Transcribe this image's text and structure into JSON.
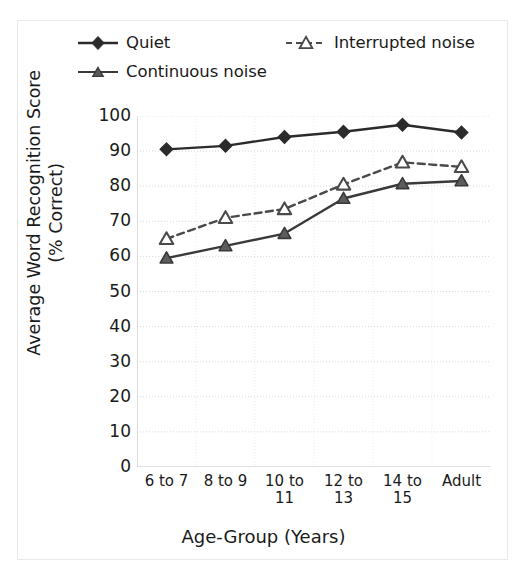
{
  "chart_data": {
    "type": "line",
    "title": "",
    "xlabel": "Age-Group (Years)",
    "ylabel": "Average Word Recognition Score (% Correct)",
    "ylabel_line1": "Average Word Recognition Score",
    "ylabel_line2": "(% Correct)",
    "categories": [
      "6 to 7",
      "8 to 9",
      "10 to\n11",
      "12 to\n13",
      "14 to\n15",
      "Adult"
    ],
    "category_labels": [
      {
        "line1": "6 to 7",
        "line2": ""
      },
      {
        "line1": "8 to 9",
        "line2": ""
      },
      {
        "line1": "10 to",
        "line2": "11"
      },
      {
        "line1": "12 to",
        "line2": "13"
      },
      {
        "line1": "14 to",
        "line2": "15"
      },
      {
        "line1": "Adult",
        "line2": ""
      }
    ],
    "ylim": [
      0,
      100
    ],
    "yticks": [
      100,
      90,
      80,
      70,
      60,
      50,
      40,
      30,
      20,
      10,
      0
    ],
    "grid": true,
    "legend_position": "top",
    "series": [
      {
        "name": "Quiet",
        "values": [
          90.5,
          91.5,
          94.0,
          95.5,
          97.5,
          95.3
        ],
        "marker": "diamond-filled",
        "line_style": "solid",
        "color": "#2b2b2b"
      },
      {
        "name": "Interrupted noise",
        "values": [
          65.0,
          71.0,
          73.5,
          80.5,
          86.8,
          85.5
        ],
        "marker": "triangle-open",
        "line_style": "dashed",
        "color": "#4a4a4a"
      },
      {
        "name": "Continuous noise",
        "values": [
          59.5,
          63.0,
          66.5,
          76.5,
          80.7,
          81.5
        ],
        "marker": "triangle-filled",
        "line_style": "solid",
        "color": "#3a3a3a"
      }
    ]
  },
  "colors": {
    "quiet": "#2b2b2b",
    "interrupted": "#4a4a4a",
    "continuous": "#3a3a3a",
    "grid": "#d8d8d8",
    "axis": "#c8c8c8",
    "figure_border": "#e9e9e9",
    "text": "#1a1a1a"
  }
}
